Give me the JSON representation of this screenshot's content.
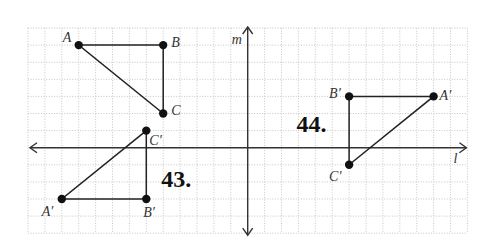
{
  "grid": {
    "origin_x": 28,
    "origin_y": 28,
    "cell_w": 16.9,
    "cell_h": 17.1,
    "cols": 26,
    "rows": 12
  },
  "axes": {
    "m": {
      "label": "m",
      "col": 13,
      "orientation": "vertical"
    },
    "l": {
      "label": "l",
      "row": 7,
      "orientation": "horizontal"
    }
  },
  "problems": [
    {
      "number": "43.",
      "label_pos": [
        8,
        9
      ],
      "original": {
        "A": {
          "label": "A",
          "pos": [
            3,
            1
          ]
        },
        "B": {
          "label": "B",
          "pos": [
            8,
            1
          ]
        },
        "C": {
          "label": "C",
          "pos": [
            8,
            5
          ]
        }
      },
      "image": {
        "A": {
          "label": "A′",
          "pos": [
            2,
            10
          ]
        },
        "B": {
          "label": "B′",
          "pos": [
            7,
            10
          ]
        },
        "C": {
          "label": "C′",
          "pos": [
            7,
            6
          ]
        }
      }
    },
    {
      "number": "44.",
      "label_pos": [
        16,
        5.8
      ],
      "image": {
        "A": {
          "label": "A′",
          "pos": [
            24,
            4
          ]
        },
        "B": {
          "label": "B′",
          "pos": [
            19,
            4
          ]
        },
        "C": {
          "label": "C′",
          "pos": [
            19,
            8
          ]
        }
      }
    }
  ]
}
